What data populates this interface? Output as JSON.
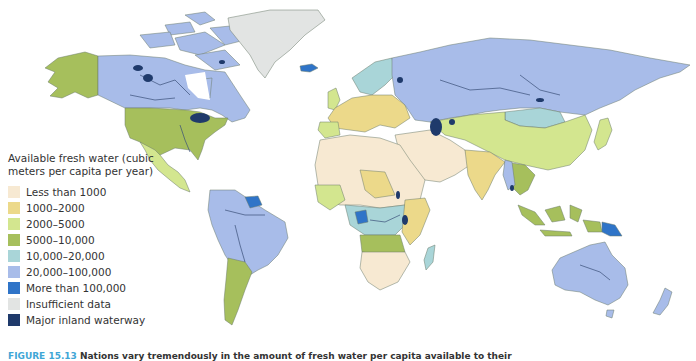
{
  "legend": {
    "title": "Available fresh water (cubic meters per capita per year)",
    "items": [
      {
        "label": "Less than 1000",
        "color": "#f7e9d2"
      },
      {
        "label": "1000–2000",
        "color": "#ecd98a"
      },
      {
        "label": "2000–5000",
        "color": "#d3e68f"
      },
      {
        "label": "5000–10,000",
        "color": "#a6bf5c"
      },
      {
        "label": "10,000–20,000",
        "color": "#a9d5d8"
      },
      {
        "label": "20,000–100,000",
        "color": "#a8bce9"
      },
      {
        "label": "More than 100,000",
        "color": "#2f74c8"
      },
      {
        "label": "Insufficient data",
        "color": "#e2e4e3"
      },
      {
        "label": "Major inland waterway",
        "color": "#1f3a6b"
      }
    ]
  },
  "caption": {
    "figure": "FIGURE 15.13",
    "text": "Nations vary tremendously in the amount of fresh water per capita available to their"
  },
  "map": {
    "regions": [
      {
        "name": "Alaska",
        "class": "5000–10,000"
      },
      {
        "name": "Canada",
        "class": "20,000–100,000"
      },
      {
        "name": "Greenland",
        "class": "Insufficient data"
      },
      {
        "name": "Iceland",
        "class": "More than 100,000"
      },
      {
        "name": "United States",
        "class": "5000–10,000"
      },
      {
        "name": "Mexico",
        "class": "2000–5000"
      },
      {
        "name": "South America",
        "class": "20,000–100,000"
      },
      {
        "name": "Guyana/Suriname",
        "class": "More than 100,000"
      },
      {
        "name": "Argentina",
        "class": "5000–10,000"
      },
      {
        "name": "North Africa",
        "class": "Less than 1000"
      },
      {
        "name": "Congo",
        "class": "More than 100,000"
      },
      {
        "name": "Central Africa",
        "class": "10,000–20,000"
      },
      {
        "name": "Angola/Zambia",
        "class": "5000–10,000"
      },
      {
        "name": "Southern Africa",
        "class": "Less than 1000"
      },
      {
        "name": "Madagascar",
        "class": "10,000–20,000"
      },
      {
        "name": "Europe",
        "class": "1000–2000"
      },
      {
        "name": "Scandinavia",
        "class": "10,000–20,000"
      },
      {
        "name": "Russia",
        "class": "20,000–100,000"
      },
      {
        "name": "Mongolia",
        "class": "10,000–20,000"
      },
      {
        "name": "Central Asia/China",
        "class": "2000–5000"
      },
      {
        "name": "Middle East",
        "class": "Less than 1000"
      },
      {
        "name": "India",
        "class": "1000–2000"
      },
      {
        "name": "Southeast Asia",
        "class": "5000–10,000"
      },
      {
        "name": "Papua New Guinea",
        "class": "More than 100,000"
      },
      {
        "name": "Australia",
        "class": "20,000–100,000"
      },
      {
        "name": "New Zealand",
        "class": "20,000–100,000"
      }
    ]
  }
}
